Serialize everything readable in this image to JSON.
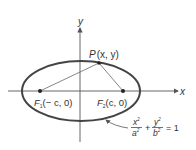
{
  "diagram": {
    "axes": {
      "x_label": "x",
      "y_label": "y"
    },
    "point_P": {
      "name": "P",
      "coords": "(x, y)"
    },
    "focus_1": {
      "name": "F",
      "sub": "1",
      "coords": "(− c, 0)"
    },
    "focus_2": {
      "name": "F",
      "sub": "2",
      "coords": "(c, 0)"
    },
    "equation": {
      "x_num": "x",
      "x_den": "a",
      "y_num": "y",
      "y_den": "b",
      "exp": "2",
      "plus": "+",
      "rhs": "= 1"
    },
    "colors": {
      "ellipse": "#444444",
      "axes": "#555555",
      "lines": "#666666"
    }
  }
}
